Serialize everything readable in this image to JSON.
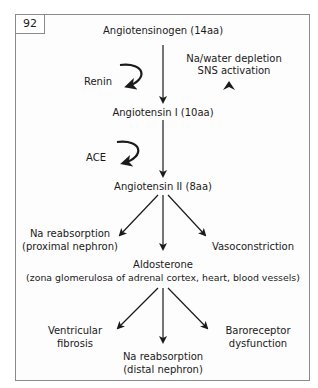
{
  "figure": {
    "number": "92",
    "nodes": {
      "angiotensinogen": "Angiotensinogen (14aa)",
      "stimulus_line1": "Na/water depletion",
      "stimulus_line2": "SNS activation",
      "renin": "Renin",
      "angiotensin1": "Angiotensin I (10aa)",
      "ace": "ACE",
      "angiotensin2": "Angiotensin II (8aa)",
      "na_prox_line1": "Na reabsorption",
      "na_prox_line2": "(proximal nephron)",
      "vasoconstriction": "Vasoconstriction",
      "aldosterone_line1": "Aldosterone",
      "aldosterone_line2": "(zona glomerulosa of adrenal cortex, heart, blood vessels)",
      "vent_line1": "Ventricular",
      "vent_line2": "fibrosis",
      "na_distal_line1": "Na reabsorption",
      "na_distal_line2": "(distal nephron)",
      "baro_line1": "Baroreceptor",
      "baro_line2": "dysfunction"
    },
    "colors": {
      "stroke": "#1a1a1a",
      "frame": "#8a8a8a"
    }
  }
}
